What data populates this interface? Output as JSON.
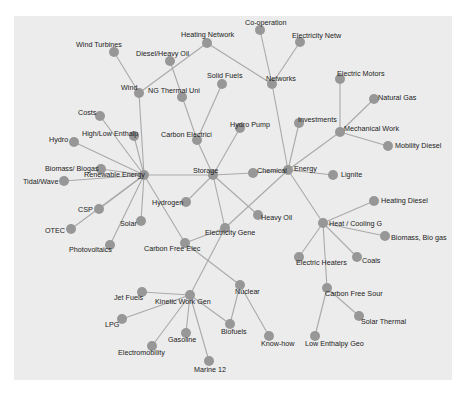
{
  "diagram": {
    "type": "network-graph",
    "colors": {
      "background": "#ffffff",
      "panel": "#ececec",
      "node": "#979797",
      "edge": "#a9a9a9",
      "label": "#222222"
    },
    "node_radius": 5,
    "nodes": [
      {
        "id": "co-operation",
        "label": "Co-operation",
        "x": 260,
        "y": 30,
        "lx": 245,
        "ly": 25
      },
      {
        "id": "electricity-netw",
        "label": "Electricity Netw",
        "x": 300,
        "y": 42,
        "lx": 292,
        "ly": 38
      },
      {
        "id": "heating-network",
        "label": "Heating Network",
        "x": 207,
        "y": 43,
        "lx": 181,
        "ly": 37
      },
      {
        "id": "wind-turbines",
        "label": "Wind Turbines",
        "x": 114,
        "y": 52,
        "lx": 76,
        "ly": 47
      },
      {
        "id": "diesel-heavy-oil",
        "label": "Diesel/Heavy Oil",
        "x": 170,
        "y": 61,
        "lx": 136,
        "ly": 56
      },
      {
        "id": "networks",
        "label": "Networks",
        "x": 272,
        "y": 84,
        "lx": 266,
        "ly": 81
      },
      {
        "id": "solid-fuels",
        "label": "Solid Fuels",
        "x": 222,
        "y": 84,
        "lx": 207,
        "ly": 78
      },
      {
        "id": "electric-motors",
        "label": "Electric Motors",
        "x": 340,
        "y": 79,
        "lx": 337,
        "ly": 76
      },
      {
        "id": "wind",
        "label": "Wind",
        "x": 139,
        "y": 93,
        "lx": 121,
        "ly": 90
      },
      {
        "id": "ng-thermal-uni",
        "label": "NG Thermal Uni",
        "x": 182,
        "y": 97,
        "lx": 148,
        "ly": 93
      },
      {
        "id": "natural-gas",
        "label": "Natural Gas",
        "x": 374,
        "y": 99,
        "lx": 378,
        "ly": 100
      },
      {
        "id": "costs",
        "label": "Costs",
        "x": 100,
        "y": 116,
        "lx": 78,
        "ly": 115
      },
      {
        "id": "investments",
        "label": "Investments",
        "x": 299,
        "y": 123,
        "lx": 298,
        "ly": 122
      },
      {
        "id": "mechanical-work",
        "label": "Mechanical Work",
        "x": 340,
        "y": 132,
        "lx": 344,
        "ly": 131
      },
      {
        "id": "hydro-pump",
        "label": "Hydro Pump",
        "x": 240,
        "y": 128,
        "lx": 230,
        "ly": 127
      },
      {
        "id": "high-low-enthalp",
        "label": "High/Low Enthalp",
        "x": 134,
        "y": 136,
        "lx": 82,
        "ly": 136
      },
      {
        "id": "carbon-electrici",
        "label": "Carbon Electrici",
        "x": 197,
        "y": 140,
        "lx": 161,
        "ly": 137
      },
      {
        "id": "hydro",
        "label": "Hydro",
        "x": 74,
        "y": 142,
        "lx": 49,
        "ly": 142
      },
      {
        "id": "mobility-diesel",
        "label": "Mobility Diesel",
        "x": 388,
        "y": 146,
        "lx": 395,
        "ly": 148
      },
      {
        "id": "biomass-biogas",
        "label": "Biomass/ Biogas",
        "x": 101,
        "y": 169,
        "lx": 45,
        "ly": 171
      },
      {
        "id": "renewable-energy",
        "label": "Renewable Energy",
        "x": 144,
        "y": 175,
        "lx": 84,
        "ly": 177
      },
      {
        "id": "storage",
        "label": "Storage",
        "x": 213,
        "y": 175,
        "lx": 193,
        "ly": 173
      },
      {
        "id": "chemical",
        "label": "Chemical",
        "x": 253,
        "y": 173,
        "lx": 257,
        "ly": 173
      },
      {
        "id": "energy",
        "label": "Energy",
        "x": 288,
        "y": 170,
        "lx": 294,
        "ly": 171
      },
      {
        "id": "lignite",
        "label": "Lignite",
        "x": 333,
        "y": 175,
        "lx": 341,
        "ly": 177
      },
      {
        "id": "tidal-wave",
        "label": "Tidal/Wave",
        "x": 64,
        "y": 181,
        "lx": 23,
        "ly": 184
      },
      {
        "id": "hydrogen",
        "label": "Hydrogen",
        "x": 186,
        "y": 202,
        "lx": 152,
        "ly": 205
      },
      {
        "id": "heavy-oil",
        "label": "Heavy Oil",
        "x": 258,
        "y": 215,
        "lx": 261,
        "ly": 220
      },
      {
        "id": "heating-diesel",
        "label": "Heating Diesel",
        "x": 374,
        "y": 201,
        "lx": 381,
        "ly": 203
      },
      {
        "id": "csp",
        "label": "CSP",
        "x": 99,
        "y": 209,
        "lx": 78,
        "ly": 212
      },
      {
        "id": "solar",
        "label": "Solar",
        "x": 141,
        "y": 221,
        "lx": 120,
        "ly": 226
      },
      {
        "id": "electricity-gene",
        "label": "Electricity Gene",
        "x": 225,
        "y": 228,
        "lx": 205,
        "ly": 235
      },
      {
        "id": "heat-cooling-g",
        "label": "Heat / Cooling G",
        "x": 323,
        "y": 223,
        "lx": 329,
        "ly": 226
      },
      {
        "id": "otec",
        "label": "OTEC",
        "x": 71,
        "y": 229,
        "lx": 45,
        "ly": 233
      },
      {
        "id": "biomass-bio-gas",
        "label": "Biomass, Bio gas",
        "x": 385,
        "y": 236,
        "lx": 391,
        "ly": 240
      },
      {
        "id": "carbon-free-elec",
        "label": "Carbon Free Elec",
        "x": 185,
        "y": 243,
        "lx": 144,
        "ly": 251
      },
      {
        "id": "photovoltaics",
        "label": "Photovoltaics",
        "x": 110,
        "y": 245,
        "lx": 69,
        "ly": 252
      },
      {
        "id": "electric-heaters",
        "label": "Electric Heaters",
        "x": 299,
        "y": 257,
        "lx": 296,
        "ly": 265
      },
      {
        "id": "coals",
        "label": "Coals",
        "x": 357,
        "y": 257,
        "lx": 362,
        "ly": 263
      },
      {
        "id": "nuclear",
        "label": "Nuclear",
        "x": 240,
        "y": 285,
        "lx": 235,
        "ly": 294
      },
      {
        "id": "carbon-free-sour",
        "label": "Carbon Free Sour",
        "x": 327,
        "y": 288,
        "lx": 325,
        "ly": 296
      },
      {
        "id": "jet-fuels",
        "label": "Jet Fuels",
        "x": 142,
        "y": 292,
        "lx": 114,
        "ly": 300
      },
      {
        "id": "kinetic-work-gen",
        "label": "Kinetic Work Gen",
        "x": 190,
        "y": 295,
        "lx": 155,
        "ly": 304
      },
      {
        "id": "lpg",
        "label": "LPG",
        "x": 122,
        "y": 319,
        "lx": 105,
        "ly": 327
      },
      {
        "id": "biofuels",
        "label": "Biofuels",
        "x": 230,
        "y": 324,
        "lx": 221,
        "ly": 334
      },
      {
        "id": "solar-thermal",
        "label": "Solar Thermal",
        "x": 359,
        "y": 316,
        "lx": 361,
        "ly": 324
      },
      {
        "id": "gasoline",
        "label": "Gasoline",
        "x": 186,
        "y": 333,
        "lx": 168,
        "ly": 342
      },
      {
        "id": "know-how",
        "label": "Know-how",
        "x": 269,
        "y": 336,
        "lx": 261,
        "ly": 346
      },
      {
        "id": "low-enthalpy-geo",
        "label": "Low Enthalpy Geo",
        "x": 315,
        "y": 336,
        "lx": 305,
        "ly": 346
      },
      {
        "id": "electromobility",
        "label": "Electromobility",
        "x": 152,
        "y": 346,
        "lx": 118,
        "ly": 355
      },
      {
        "id": "marine-12",
        "label": "Marine 12",
        "x": 209,
        "y": 361,
        "lx": 194,
        "ly": 372
      }
    ],
    "edges": [
      [
        "heating-network",
        "wind"
      ],
      [
        "heating-network",
        "networks"
      ],
      [
        "co-operation",
        "networks"
      ],
      [
        "electricity-netw",
        "networks"
      ],
      [
        "networks",
        "energy"
      ],
      [
        "wind-turbines",
        "wind"
      ],
      [
        "wind",
        "renewable-energy"
      ],
      [
        "diesel-heavy-oil",
        "carbon-electrici"
      ],
      [
        "solid-fuels",
        "carbon-electrici"
      ],
      [
        "carbon-electrici",
        "storage"
      ],
      [
        "costs",
        "renewable-energy"
      ],
      [
        "high-low-enthalp",
        "renewable-energy"
      ],
      [
        "hydro",
        "renewable-energy"
      ],
      [
        "biomass-biogas",
        "renewable-energy"
      ],
      [
        "tidal-wave",
        "renewable-energy"
      ],
      [
        "csp",
        "renewable-energy"
      ],
      [
        "otec",
        "renewable-energy"
      ],
      [
        "solar",
        "renewable-energy"
      ],
      [
        "photovoltaics",
        "renewable-energy"
      ],
      [
        "renewable-energy",
        "storage"
      ],
      [
        "renewable-energy",
        "carbon-free-elec"
      ],
      [
        "hydro-pump",
        "storage"
      ],
      [
        "hydrogen",
        "storage"
      ],
      [
        "storage",
        "chemical"
      ],
      [
        "storage",
        "heavy-oil"
      ],
      [
        "storage",
        "electricity-gene"
      ],
      [
        "chemical",
        "energy"
      ],
      [
        "investments",
        "energy"
      ],
      [
        "mechanical-work",
        "energy"
      ],
      [
        "electric-motors",
        "mechanical-work"
      ],
      [
        "natural-gas",
        "mechanical-work"
      ],
      [
        "mobility-diesel",
        "mechanical-work"
      ],
      [
        "lignite",
        "energy"
      ],
      [
        "energy",
        "electricity-gene"
      ],
      [
        "energy",
        "heat-cooling-g"
      ],
      [
        "heating-diesel",
        "heat-cooling-g"
      ],
      [
        "biomass-bio-gas",
        "heat-cooling-g"
      ],
      [
        "electric-heaters",
        "heat-cooling-g"
      ],
      [
        "coals",
        "heat-cooling-g"
      ],
      [
        "heat-cooling-g",
        "carbon-free-sour"
      ],
      [
        "carbon-free-sour",
        "low-enthalpy-geo"
      ],
      [
        "carbon-free-sour",
        "solar-thermal"
      ],
      [
        "electricity-gene",
        "carbon-free-elec"
      ],
      [
        "electricity-gene",
        "kinetic-work-gen"
      ],
      [
        "carbon-free-elec",
        "nuclear"
      ],
      [
        "nuclear",
        "biofuels"
      ],
      [
        "nuclear",
        "know-how"
      ],
      [
        "jet-fuels",
        "kinetic-work-gen"
      ],
      [
        "lpg",
        "kinetic-work-gen"
      ],
      [
        "kinetic-work-gen",
        "biofuels"
      ],
      [
        "kinetic-work-gen",
        "gasoline"
      ],
      [
        "kinetic-work-gen",
        "electromobility"
      ],
      [
        "kinetic-work-gen",
        "marine-12"
      ]
    ]
  }
}
